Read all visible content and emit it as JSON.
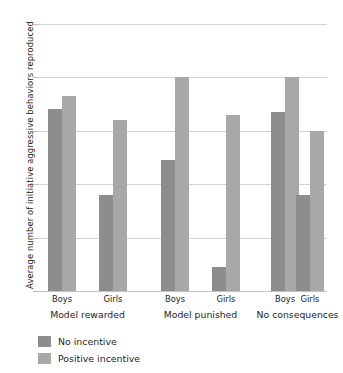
{
  "chart_data": {
    "type": "bar",
    "title": "",
    "subtitle": "",
    "xlabel": "",
    "ylabel": "Average number of initiative aggressive behaviors reproduced",
    "ylim": [
      0,
      5
    ],
    "ytick_labels": [
      "0",
      "1",
      "2",
      "3",
      "4",
      "5"
    ],
    "ytick_values": [
      0,
      1,
      2,
      3,
      4,
      5
    ],
    "grid": true,
    "legend_position": "bottom-left",
    "categories": [
      "Boys",
      "Girls",
      "Boys",
      "Girls",
      "Boys",
      "Girls"
    ],
    "groups": [
      {
        "label": "Model rewarded",
        "subcategories": [
          "Boys",
          "Girls"
        ]
      },
      {
        "label": "Model punished",
        "subcategories": [
          "Boys",
          "Girls"
        ]
      },
      {
        "label": "No consequences",
        "subcategories": [
          "Boys",
          "Girls"
        ]
      }
    ],
    "series": [
      {
        "name": "No incentive",
        "color": "#8d8d8d",
        "values": [
          3.4,
          1.8,
          2.45,
          0.45,
          3.35,
          1.8
        ]
      },
      {
        "name": "Positive incentive",
        "color": "#a8a8a8",
        "values": [
          3.65,
          3.2,
          4.0,
          3.3,
          4.0,
          3.0
        ]
      }
    ],
    "bars": [
      {
        "group": "Model rewarded",
        "category": "Boys",
        "series": "No incentive",
        "value": 3.4
      },
      {
        "group": "Model rewarded",
        "category": "Boys",
        "series": "Positive incentive",
        "value": 3.65
      },
      {
        "group": "Model rewarded",
        "category": "Girls",
        "series": "No incentive",
        "value": 1.8
      },
      {
        "group": "Model rewarded",
        "category": "Girls",
        "series": "Positive incentive",
        "value": 3.2
      },
      {
        "group": "Model punished",
        "category": "Boys",
        "series": "No incentive",
        "value": 2.45
      },
      {
        "group": "Model punished",
        "category": "Boys",
        "series": "Positive incentive",
        "value": 4.0
      },
      {
        "group": "Model punished",
        "category": "Girls",
        "series": "No incentive",
        "value": 0.45
      },
      {
        "group": "Model punished",
        "category": "Girls",
        "series": "Positive incentive",
        "value": 3.3
      },
      {
        "group": "No consequences",
        "category": "Boys",
        "series": "No incentive",
        "value": 3.35
      },
      {
        "group": "No consequences",
        "category": "Boys",
        "series": "Positive incentive",
        "value": 4.0
      },
      {
        "group": "No consequences",
        "category": "Girls",
        "series": "No incentive",
        "value": 1.8
      },
      {
        "group": "No consequences",
        "category": "Girls",
        "series": "Positive incentive",
        "value": 3.0
      }
    ]
  },
  "axis": {
    "y_title": "Average number of initiative aggressive behaviors reproduced",
    "ticks": [
      "5",
      "4",
      "3",
      "2",
      "1",
      "0"
    ]
  },
  "xlabels": {
    "t0": "Boys",
    "t1": "Girls",
    "t2": "Boys",
    "t3": "Girls",
    "t4": "Boys",
    "t5": "Girls"
  },
  "group_labels": {
    "g0": "Model rewarded",
    "g1": "Model punished",
    "g2": "No consequences"
  },
  "legend": {
    "items": [
      {
        "label": "No incentive",
        "color": "#8d8d8d"
      },
      {
        "label": "Positive incentive",
        "color": "#a8a8a8"
      }
    ],
    "item0_label": "No incentive",
    "item1_label": "Positive incentive"
  },
  "colors": {
    "series_no_incentive": "#8d8d8d",
    "series_positive_incentive": "#a8a8a8",
    "gridline": "#d2d2d2",
    "text": "#231f20",
    "background": "#ffffff"
  }
}
